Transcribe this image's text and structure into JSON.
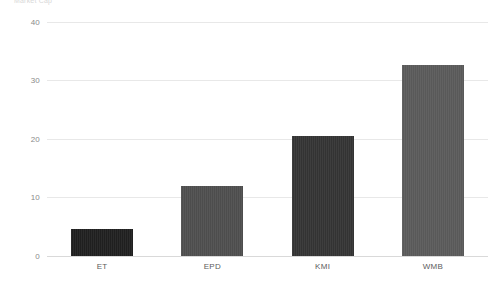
{
  "caption": "Market Cap",
  "chart_data": {
    "type": "bar",
    "title": "",
    "subtitle": "",
    "xlabel": "",
    "ylabel": "",
    "categories": [
      "ET",
      "EPD",
      "KMI",
      "WMB"
    ],
    "values": [
      4.6,
      12.0,
      20.5,
      32.6
    ],
    "series": [
      {
        "name": "Value",
        "values": [
          4.6,
          12.0,
          20.5,
          32.6
        ]
      }
    ],
    "bar_colors": [
      "#1f1f1f",
      "#4d4d4d",
      "#333333",
      "#595959"
    ],
    "ylim": [
      0,
      42
    ],
    "yticks": [
      0,
      10,
      20,
      30,
      40
    ],
    "ytick_labels": [
      "0",
      "10",
      "20",
      "30",
      "40"
    ],
    "grid": true,
    "grid_color": "#e8e8e8",
    "legend": false,
    "legend_position": "none",
    "background": "#ffffff"
  }
}
